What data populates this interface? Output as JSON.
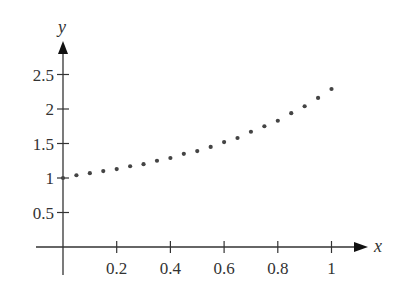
{
  "chart_data": {
    "type": "scatter",
    "title": "",
    "xlabel": "x",
    "ylabel": "y",
    "xlim": [
      0,
      1.1
    ],
    "ylim": [
      0,
      2.9
    ],
    "grid": false,
    "legend": null,
    "x_ticks": [
      0.2,
      0.4,
      0.6,
      0.8,
      1
    ],
    "x_tick_labels": [
      "0.2",
      "0.4",
      "0.6",
      "0.8",
      "1"
    ],
    "y_ticks": [
      0.5,
      1,
      1.5,
      2,
      2.5
    ],
    "y_tick_labels": [
      "0.5",
      "1",
      "1.5",
      "2",
      "2.5"
    ],
    "series": [
      {
        "name": "points",
        "marker": "dot",
        "color": "#444444",
        "x": [
          0,
          0.05,
          0.1,
          0.15,
          0.2,
          0.25,
          0.3,
          0.35,
          0.4,
          0.45,
          0.5,
          0.55,
          0.6,
          0.65,
          0.7,
          0.75,
          0.8,
          0.85,
          0.9,
          0.95,
          1.0
        ],
        "y": [
          1.0,
          1.04,
          1.07,
          1.1,
          1.13,
          1.17,
          1.2,
          1.25,
          1.29,
          1.35,
          1.39,
          1.45,
          1.52,
          1.58,
          1.67,
          1.75,
          1.83,
          1.94,
          2.04,
          2.16,
          2.29
        ]
      }
    ]
  },
  "colors": {
    "axis": "#333333",
    "points": "#444444",
    "background": "#ffffff"
  }
}
